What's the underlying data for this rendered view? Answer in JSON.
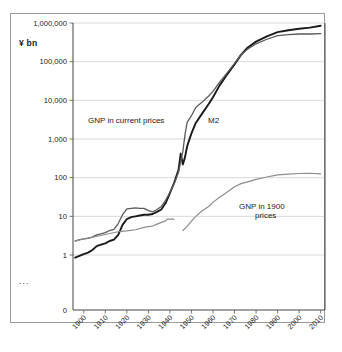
{
  "chart_data": {
    "type": "line",
    "title": "",
    "xlabel": "",
    "ylabel": "",
    "unit_label": "¥ bn",
    "y_scale": "log",
    "ylim": [
      1,
      1000000
    ],
    "xlim": [
      1895,
      2012
    ],
    "grid": true,
    "legend_position": "inline-annotations",
    "y_ticks": [
      "0",
      "1",
      "10",
      "100",
      "1,000",
      "10,000",
      "100,000",
      "1,000,000"
    ],
    "x_ticks": [
      "1900",
      "1910",
      "1920",
      "1930",
      "1940",
      "1950",
      "1960",
      "1970",
      "1980",
      "1990",
      "2000",
      "2010"
    ],
    "footnote": "...",
    "series": [
      {
        "name": "M2",
        "label": "M2",
        "color": "#1a1a1a",
        "width": 1.9,
        "points": [
          [
            1896,
            0.85
          ],
          [
            1898,
            0.95
          ],
          [
            1900,
            1.05
          ],
          [
            1902,
            1.15
          ],
          [
            1904,
            1.35
          ],
          [
            1906,
            1.7
          ],
          [
            1908,
            1.85
          ],
          [
            1910,
            2.0
          ],
          [
            1912,
            2.3
          ],
          [
            1914,
            2.5
          ],
          [
            1916,
            3.3
          ],
          [
            1918,
            6.0
          ],
          [
            1920,
            8.5
          ],
          [
            1922,
            9.5
          ],
          [
            1924,
            10.0
          ],
          [
            1926,
            10.5
          ],
          [
            1928,
            11.0
          ],
          [
            1930,
            11.0
          ],
          [
            1932,
            11.5
          ],
          [
            1934,
            13.0
          ],
          [
            1936,
            15.0
          ],
          [
            1938,
            22.0
          ],
          [
            1940,
            40.0
          ],
          [
            1942,
            75.0
          ],
          [
            1944,
            160.0
          ],
          [
            1945,
            420.0
          ],
          [
            1946,
            220.0
          ],
          [
            1947,
            340.0
          ],
          [
            1948,
            650.0
          ],
          [
            1950,
            1400.0
          ],
          [
            1952,
            2600.0
          ],
          [
            1955,
            4600.0
          ],
          [
            1958,
            8000.0
          ],
          [
            1960,
            12000.0
          ],
          [
            1963,
            24000.0
          ],
          [
            1966,
            42000.0
          ],
          [
            1970,
            85000.0
          ],
          [
            1973,
            150000.0
          ],
          [
            1976,
            230000.0
          ],
          [
            1980,
            330000.0
          ],
          [
            1985,
            450000.0
          ],
          [
            1990,
            580000.0
          ],
          [
            1995,
            650000.0
          ],
          [
            2000,
            710000.0
          ],
          [
            2005,
            760000.0
          ],
          [
            2010,
            850000.0
          ]
        ]
      },
      {
        "name": "GNP in current prices",
        "label": "GNP in current prices",
        "color": "#5a5a5a",
        "width": 1.3,
        "points": [
          [
            1896,
            2.3
          ],
          [
            1898,
            2.5
          ],
          [
            1900,
            2.6
          ],
          [
            1902,
            2.7
          ],
          [
            1904,
            2.9
          ],
          [
            1906,
            3.3
          ],
          [
            1908,
            3.5
          ],
          [
            1910,
            3.8
          ],
          [
            1912,
            4.3
          ],
          [
            1914,
            4.6
          ],
          [
            1916,
            6.5
          ],
          [
            1918,
            11.0
          ],
          [
            1920,
            15.5
          ],
          [
            1922,
            16.0
          ],
          [
            1924,
            16.5
          ],
          [
            1926,
            16.0
          ],
          [
            1928,
            16.0
          ],
          [
            1930,
            14.0
          ],
          [
            1932,
            13.0
          ],
          [
            1934,
            15.0
          ],
          [
            1936,
            18.0
          ],
          [
            1938,
            26.0
          ],
          [
            1940,
            42.0
          ],
          [
            1942,
            70.0
          ],
          [
            1944,
            140.0
          ],
          [
            1946,
            480.0
          ],
          [
            1947,
            1300.0
          ],
          [
            1948,
            2700.0
          ],
          [
            1950,
            4000.0
          ],
          [
            1952,
            6500.0
          ],
          [
            1955,
            9000.0
          ],
          [
            1958,
            13000.0
          ],
          [
            1960,
            17000.0
          ],
          [
            1963,
            29000.0
          ],
          [
            1966,
            47000.0
          ],
          [
            1970,
            90000.0
          ],
          [
            1973,
            150000.0
          ],
          [
            1976,
            210000.0
          ],
          [
            1980,
            290000.0
          ],
          [
            1985,
            380000.0
          ],
          [
            1990,
            470000.0
          ],
          [
            1995,
            500000.0
          ],
          [
            2000,
            520000.0
          ],
          [
            2005,
            520000.0
          ],
          [
            2010,
            530000.0
          ]
        ]
      },
      {
        "name": "GNP in 1900 prices",
        "label": "GNP in 1900 prices",
        "color": "#8c8c8c",
        "width": 1.2,
        "segments": [
          [
            [
              1896,
              2.3
            ],
            [
              1900,
              2.6
            ],
            [
              1904,
              2.9
            ],
            [
              1908,
              3.2
            ],
            [
              1912,
              3.6
            ],
            [
              1916,
              4.0
            ],
            [
              1920,
              4.2
            ],
            [
              1924,
              4.5
            ],
            [
              1928,
              5.2
            ],
            [
              1930,
              5.4
            ],
            [
              1932,
              5.6
            ],
            [
              1934,
              6.3
            ],
            [
              1936,
              7.0
            ],
            [
              1938,
              7.6
            ],
            [
              1939,
              8.6
            ],
            [
              1940,
              8.4
            ],
            [
              1941,
              8.6
            ],
            [
              1942,
              8.3
            ]
          ],
          [
            [
              1946,
              4.3
            ],
            [
              1948,
              5.5
            ],
            [
              1950,
              7.5
            ],
            [
              1952,
              10.0
            ],
            [
              1955,
              14.0
            ],
            [
              1958,
              18.0
            ],
            [
              1960,
              23.0
            ],
            [
              1963,
              31.0
            ],
            [
              1966,
              40.0
            ],
            [
              1970,
              58.0
            ],
            [
              1973,
              70.0
            ],
            [
              1976,
              78.0
            ],
            [
              1980,
              90.0
            ],
            [
              1985,
              104.0
            ],
            [
              1990,
              118.0
            ],
            [
              1995,
              124.0
            ],
            [
              2000,
              128.0
            ],
            [
              2005,
              130.0
            ],
            [
              2010,
              126.0
            ]
          ]
        ]
      }
    ],
    "annotations": [
      {
        "text": "GNP in current prices",
        "x": 88,
        "y": 123
      },
      {
        "text": "M2",
        "x": 208,
        "y": 123
      },
      {
        "text": "GNP in 1900",
        "x": 239,
        "y": 209
      },
      {
        "text": "prices",
        "x": 255,
        "y": 218
      }
    ]
  }
}
